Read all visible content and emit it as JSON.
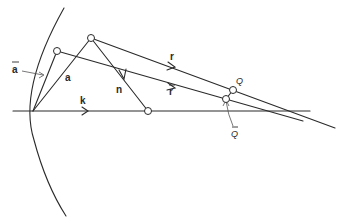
{
  "diagram": {
    "title": "",
    "labels": {
      "a_bar": "a",
      "a": "a",
      "n": "n",
      "k": "k",
      "r": "r",
      "r_bar": "r",
      "Q": "Q",
      "Q_bar": "Q"
    },
    "points": {
      "origin": {
        "x": 33,
        "y": 111
      },
      "A_bar": {
        "x": 57,
        "y": 51
      },
      "A": {
        "x": 91,
        "y": 38
      },
      "N": {
        "x": 148,
        "y": 111
      },
      "Q": {
        "x": 233,
        "y": 90
      },
      "Q_bar": {
        "x": 226,
        "y": 99
      }
    },
    "colors": {
      "stroke": "#2a2a2a",
      "background": "#ffffff"
    }
  }
}
